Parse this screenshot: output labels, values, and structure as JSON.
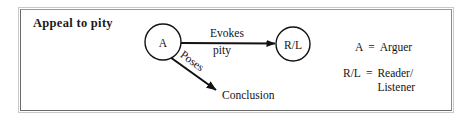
{
  "figure": {
    "title": "Appeal to pity",
    "border_color": "#6a6a6a",
    "ink_color": "#121212"
  },
  "diagram": {
    "nodes": [
      {
        "id": "arguer",
        "label": "A",
        "cx": 163,
        "cy": 42,
        "r": 18
      },
      {
        "id": "reader-listener",
        "label": "R/L",
        "cx": 293,
        "cy": 44,
        "r": 17
      }
    ],
    "edges": [
      {
        "id": "evokes-pity",
        "from": "arguer",
        "to": "reader-listener",
        "label_line_1": "Evokes",
        "label_line_2": "pity",
        "orientation": "horizontal"
      },
      {
        "id": "poses-conclusion",
        "from": "arguer",
        "to": "conclusion",
        "label": "Poses",
        "orientation": "diagonal"
      }
    ],
    "terminals": [
      {
        "id": "conclusion",
        "label": "Conclusion",
        "x": 222,
        "y": 95
      }
    ]
  },
  "legend": {
    "rows": [
      {
        "key": "A",
        "eq": "=",
        "value": "Arguer",
        "value_2": ""
      },
      {
        "key": "R/L",
        "eq": "=",
        "value": "Reader/",
        "value_2": "Listener"
      }
    ]
  }
}
